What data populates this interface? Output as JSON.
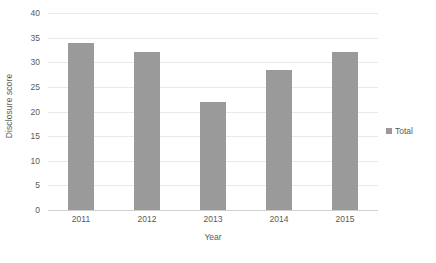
{
  "chart_data": {
    "type": "bar",
    "title": "",
    "subtitle": "",
    "xlabel": "Year",
    "ylabel": "Disclosure score",
    "categories": [
      "2011",
      "2012",
      "2013",
      "2014",
      "2015"
    ],
    "series": [
      {
        "name": "Total",
        "values": [
          34,
          32,
          22,
          28.5,
          32
        ]
      }
    ],
    "ylim": [
      0,
      40
    ],
    "ytick_step": 5,
    "yticks": [
      40,
      35,
      30,
      25,
      20,
      15,
      10,
      5,
      0
    ],
    "grid": true,
    "grid_axis": "y",
    "legend_position": "right",
    "colors": {
      "bar": "#9a9a9a",
      "gridline": "#e9e9e9",
      "baseline": "#d0d0d0",
      "text": "#5a5a5a",
      "background": "#ffffff"
    }
  },
  "legend": {
    "marker_icon": "square-marker-icon",
    "entries": [
      {
        "label": "Total"
      }
    ]
  }
}
